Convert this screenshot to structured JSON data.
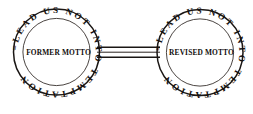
{
  "figure": {
    "background_color": "#ffffff",
    "ink_color": "#1a1614"
  },
  "medallions": [
    {
      "id": "left",
      "name": "former-motto-medallion",
      "rim_text": "=LEAD US NOT INTO TEMPTATION",
      "center_text": "FORMER MOTTO",
      "center_prefix_mark": "||",
      "cx": 56.5,
      "cy": 52,
      "r_outer": 43,
      "r_inner": 34
    },
    {
      "id": "right",
      "name": "revised-motto-medallion",
      "rim_text": "=LEAD US NOT INTO TEMPTATION",
      "center_text": "REVISED MOTTO",
      "center_prefix_mark": "",
      "cx": 200,
      "cy": 52.5,
      "r_outer": 43,
      "r_inner": 34
    }
  ],
  "connector": {
    "name": "connecting-bar",
    "x_start": 99,
    "x_end": 158,
    "y_top": 47,
    "y_bottom": 57
  }
}
